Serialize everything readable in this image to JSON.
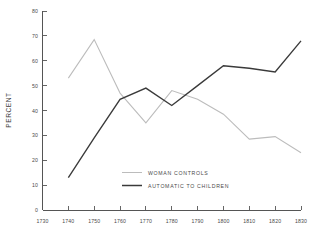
{
  "chart_data": {
    "type": "line",
    "title": "",
    "subtitle": "",
    "xlabel": "",
    "ylabel": "PERCENT",
    "xlim": [
      1730,
      1830
    ],
    "ylim": [
      0,
      80
    ],
    "grid": false,
    "legend_position": "center",
    "x": [
      1730,
      1740,
      1750,
      1760,
      1770,
      1780,
      1790,
      1800,
      1810,
      1820,
      1830
    ],
    "xtick_labels": [
      "1730",
      "1740",
      "1750",
      "1760",
      "1770",
      "1780",
      "1790",
      "1800",
      "1810",
      "1820",
      "1830"
    ],
    "ytick_values": [
      0,
      10,
      20,
      30,
      40,
      50,
      60,
      70,
      80
    ],
    "ytick_labels": [
      "0",
      "10",
      "20",
      "30",
      "40",
      "50",
      "60",
      "70",
      "80"
    ],
    "series": [
      {
        "name": "WOMAN CONTROLS",
        "color": "#bcbcbc",
        "x": [
          1740,
          1750,
          1760,
          1770,
          1780,
          1790,
          1800,
          1810,
          1820,
          1830
        ],
        "values": [
          53,
          68.5,
          47,
          35,
          48,
          44.5,
          38.5,
          28.5,
          29.5,
          23
        ]
      },
      {
        "name": "AUTOMATIC TO CHILDREN",
        "color": "#3a3a3a",
        "x": [
          1740,
          1750,
          1760,
          1770,
          1780,
          1790,
          1800,
          1810,
          1820,
          1830
        ],
        "values": [
          13,
          29,
          44.5,
          49,
          42,
          50,
          58,
          57,
          55.5,
          68
        ]
      }
    ]
  },
  "legend": {
    "items": [
      {
        "label": "WOMAN CONTROLS",
        "color": "#bcbcbc"
      },
      {
        "label": "AUTOMATIC TO CHILDREN",
        "color": "#3a3a3a"
      }
    ]
  },
  "axes": {
    "y_title": "PERCENT"
  }
}
